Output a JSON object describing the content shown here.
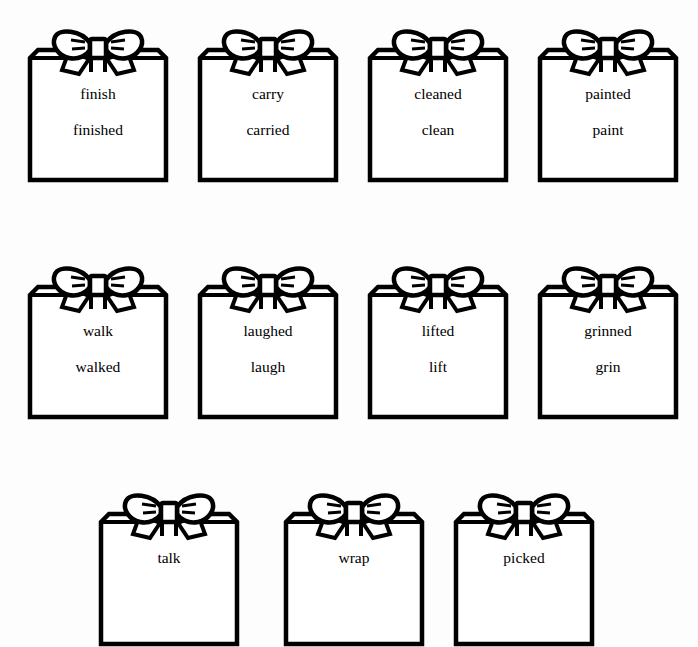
{
  "worksheet": {
    "background_color": "#fdfdfd",
    "ink_color": "#000000",
    "icon_name": "gift-box-with-bow-icon",
    "rows": [
      {
        "row_label": "row-1",
        "top": 28,
        "cards": [
          {
            "left": 29,
            "word_top": "finish",
            "word_bottom": "finished"
          },
          {
            "left": 199,
            "word_top": "carry",
            "word_bottom": "carried"
          },
          {
            "left": 369,
            "word_top": "cleaned",
            "word_bottom": "clean"
          },
          {
            "left": 539,
            "word_top": "painted",
            "word_bottom": "paint"
          }
        ]
      },
      {
        "row_label": "row-2",
        "top": 265,
        "cards": [
          {
            "left": 29,
            "word_top": "walk",
            "word_bottom": "walked"
          },
          {
            "left": 199,
            "word_top": "laughed",
            "word_bottom": "laugh"
          },
          {
            "left": 369,
            "word_top": "lifted",
            "word_bottom": "lift"
          },
          {
            "left": 539,
            "word_top": "grinned",
            "word_bottom": "grin"
          }
        ]
      },
      {
        "row_label": "row-3",
        "top": 492,
        "cards": [
          {
            "left": 100,
            "word_top": "talk",
            "word_bottom": ""
          },
          {
            "left": 285,
            "word_top": "wrap",
            "word_bottom": ""
          },
          {
            "left": 455,
            "word_top": "picked",
            "word_bottom": ""
          }
        ]
      }
    ]
  }
}
